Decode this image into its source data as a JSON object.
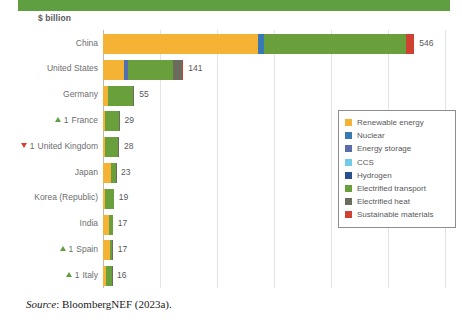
{
  "banner": {
    "color": "#5f9e41"
  },
  "axis_unit_label": "$ billion",
  "source": {
    "prefix": "Source",
    "text": ": BloombergNEF (2023a)."
  },
  "chart_data": {
    "type": "bar",
    "orientation": "horizontal",
    "title": "",
    "subtitle": "",
    "xlabel": "$ billion",
    "ylabel": "",
    "grid": true,
    "xlim": [
      0,
      600
    ],
    "xticks": [
      0,
      100,
      200,
      300,
      400,
      500,
      600
    ],
    "legend_position": "right",
    "stacked": true,
    "categories": [
      "China",
      "United States",
      "Germany",
      "France",
      "United Kingdom",
      "Japan",
      "Korea (Republic)",
      "India",
      "Spain",
      "Italy"
    ],
    "totals": [
      546,
      141,
      55,
      29,
      28,
      23,
      19,
      17,
      17,
      16
    ],
    "total_labels": [
      "546",
      "141",
      "55",
      "29",
      "28",
      "23",
      "19",
      "17",
      "17",
      "16"
    ],
    "rank_markers": [
      {
        "category": "China",
        "marker": "none",
        "rank_change": ""
      },
      {
        "category": "United States",
        "marker": "none",
        "rank_change": ""
      },
      {
        "category": "Germany",
        "marker": "none",
        "rank_change": ""
      },
      {
        "category": "France",
        "marker": "up",
        "rank_change": "1"
      },
      {
        "category": "United Kingdom",
        "marker": "down",
        "rank_change": "1"
      },
      {
        "category": "Japan",
        "marker": "none",
        "rank_change": ""
      },
      {
        "category": "Korea (Republic)",
        "marker": "none",
        "rank_change": ""
      },
      {
        "category": "India",
        "marker": "none",
        "rank_change": ""
      },
      {
        "category": "Spain",
        "marker": "up",
        "rank_change": "1"
      },
      {
        "category": "Italy",
        "marker": "up",
        "rank_change": "1"
      }
    ],
    "series": [
      {
        "name": "Renewable energy",
        "color": "#f5b335",
        "values": [
          272,
          36,
          8,
          4,
          3,
          14,
          3,
          11,
          13,
          5
        ]
      },
      {
        "name": "Nuclear",
        "color": "#3878b4",
        "values": [
          10,
          3,
          0,
          0,
          0,
          0,
          0,
          0,
          0,
          0
        ]
      },
      {
        "name": "Energy storage",
        "color": "#5b6bab",
        "values": [
          0,
          5,
          0,
          0,
          0,
          0,
          0,
          0,
          0,
          0
        ]
      },
      {
        "name": "CCS",
        "color": "#6fcbe8",
        "values": [
          0,
          0,
          0,
          0,
          0,
          0,
          0,
          0,
          0,
          0
        ]
      },
      {
        "name": "Hydrogen",
        "color": "#2a4f91",
        "values": [
          0,
          0,
          0,
          0,
          0,
          0,
          0,
          0,
          0,
          0
        ]
      },
      {
        "name": "Electrified transport",
        "color": "#6aa03c",
        "values": [
          250,
          78,
          45,
          24,
          24,
          8,
          16,
          6,
          3,
          10
        ]
      },
      {
        "name": "Electrified heat",
        "color": "#6b6b5e",
        "values": [
          0,
          16,
          2,
          1,
          1,
          1,
          0,
          0,
          1,
          1
        ]
      },
      {
        "name": "Sustainable materials",
        "color": "#cf4130",
        "values": [
          14,
          3,
          0,
          0,
          0,
          0,
          0,
          0,
          0,
          0
        ]
      }
    ]
  },
  "legend": {
    "items": [
      {
        "label": "Renewable energy",
        "color": "#f5b335"
      },
      {
        "label": "Nuclear",
        "color": "#3878b4"
      },
      {
        "label": "Energy storage",
        "color": "#5b6bab"
      },
      {
        "label": "CCS",
        "color": "#6fcbe8"
      },
      {
        "label": "Hydrogen",
        "color": "#2a4f91"
      },
      {
        "label": "Electrified transport",
        "color": "#6aa03c"
      },
      {
        "label": "Electrified heat",
        "color": "#6b6b5e"
      },
      {
        "label": "Sustainable materials",
        "color": "#cf4130"
      }
    ]
  }
}
